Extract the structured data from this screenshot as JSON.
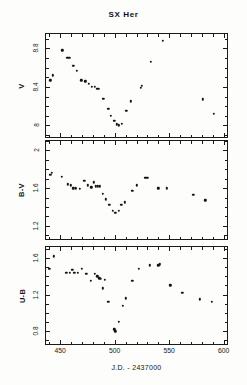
{
  "figure": {
    "title": "SX Her",
    "xlabel": "J.D.  -  2437000",
    "background": "#fdfdfc",
    "marker_color": "#141414",
    "axis_color": "#1a1a1a"
  },
  "panels": [
    {
      "id": "panel-v",
      "ylabel": "V",
      "yticks": [
        "8",
        "8.4",
        "8.8"
      ],
      "ylim_top": 7.88,
      "ylim_bottom": 8.95
    },
    {
      "id": "panel-bv",
      "ylabel": "B-V",
      "yticks": [
        "1.2",
        "1.6",
        "2"
      ],
      "ylim_top": 1.06,
      "ylim_bottom": 2.1
    },
    {
      "id": "panel-ub",
      "ylabel": "U-B",
      "yticks": [
        "0.8",
        "1.2",
        "1.6"
      ],
      "ylim_top": 0.66,
      "ylim_bottom": 1.72
    }
  ],
  "xaxis": {
    "ticks": [
      "450",
      "500",
      "550",
      "600"
    ],
    "tick_values": [
      450,
      500,
      550,
      600
    ],
    "xlim": [
      437,
      603
    ]
  },
  "chart_data": {
    "type": "scatter",
    "title": "SX Her",
    "xlabel": "J.D.  -  2437000",
    "ylabel": "",
    "xlim": [
      437,
      603
    ],
    "grid": false,
    "legend": "none",
    "panels": [
      {
        "name": "V",
        "ylabel": "V",
        "ylim": [
          8.95,
          7.88
        ],
        "y_inverted": true,
        "yticks": [
          8,
          8.4,
          8.8
        ],
        "xticks": [
          450,
          500,
          550,
          600
        ],
        "points": [
          {
            "x": 441.0,
            "y": 8.47
          },
          {
            "x": 443.5,
            "y": 8.52
          },
          {
            "x": 452.0,
            "y": 8.78
          },
          {
            "x": 456.5,
            "y": 8.7
          },
          {
            "x": 458.5,
            "y": 8.7
          },
          {
            "x": 462.0,
            "y": 8.62
          },
          {
            "x": 465.0,
            "y": 8.57
          },
          {
            "x": 469.5,
            "y": 8.47
          },
          {
            "x": 473.0,
            "y": 8.46
          },
          {
            "x": 476.0,
            "y": 8.43
          },
          {
            "x": 479.0,
            "y": 8.4
          },
          {
            "x": 482.0,
            "y": 8.4
          },
          {
            "x": 484.0,
            "y": 8.38
          },
          {
            "x": 485.5,
            "y": 8.38
          },
          {
            "x": 489.5,
            "y": 8.28
          },
          {
            "x": 494.0,
            "y": 8.17
          },
          {
            "x": 496.5,
            "y": 8.1
          },
          {
            "x": 499.5,
            "y": 8.05
          },
          {
            "x": 502.0,
            "y": 8.01
          },
          {
            "x": 504.0,
            "y": 8.0
          },
          {
            "x": 506.5,
            "y": 8.02
          },
          {
            "x": 510.5,
            "y": 8.15
          },
          {
            "x": 515.0,
            "y": 8.25
          },
          {
            "x": 524.0,
            "y": 8.39
          },
          {
            "x": 524.8,
            "y": 8.41
          },
          {
            "x": 533.0,
            "y": 8.66
          },
          {
            "x": 544.0,
            "y": 8.88
          },
          {
            "x": 581.0,
            "y": 8.27
          },
          {
            "x": 591.0,
            "y": 8.12
          }
        ]
      },
      {
        "name": "B-V",
        "ylabel": "B-V",
        "ylim": [
          2.1,
          1.06
        ],
        "y_inverted": true,
        "yticks": [
          1.2,
          1.6,
          2.0
        ],
        "xticks": [
          450,
          500,
          550,
          600
        ],
        "points": [
          {
            "x": 441.0,
            "y": 1.74
          },
          {
            "x": 442.5,
            "y": 1.76
          },
          {
            "x": 451.5,
            "y": 1.72
          },
          {
            "x": 457.0,
            "y": 1.64
          },
          {
            "x": 459.5,
            "y": 1.63
          },
          {
            "x": 462.0,
            "y": 1.6
          },
          {
            "x": 464.5,
            "y": 1.6
          },
          {
            "x": 468.0,
            "y": 1.59
          },
          {
            "x": 472.0,
            "y": 1.68
          },
          {
            "x": 475.5,
            "y": 1.63
          },
          {
            "x": 478.5,
            "y": 1.61
          },
          {
            "x": 481.0,
            "y": 1.66
          },
          {
            "x": 482.5,
            "y": 1.62
          },
          {
            "x": 484.5,
            "y": 1.62
          },
          {
            "x": 486.5,
            "y": 1.62
          },
          {
            "x": 489.0,
            "y": 1.54
          },
          {
            "x": 492.0,
            "y": 1.48
          },
          {
            "x": 495.0,
            "y": 1.42
          },
          {
            "x": 498.5,
            "y": 1.36
          },
          {
            "x": 500.5,
            "y": 1.34
          },
          {
            "x": 503.5,
            "y": 1.36
          },
          {
            "x": 506.0,
            "y": 1.42
          },
          {
            "x": 509.0,
            "y": 1.45
          },
          {
            "x": 516.0,
            "y": 1.57
          },
          {
            "x": 520.0,
            "y": 1.63
          },
          {
            "x": 528.0,
            "y": 1.71
          },
          {
            "x": 530.0,
            "y": 1.71
          },
          {
            "x": 540.0,
            "y": 1.6
          },
          {
            "x": 548.0,
            "y": 1.6
          },
          {
            "x": 572.0,
            "y": 1.53
          },
          {
            "x": 583.0,
            "y": 1.47
          }
        ]
      },
      {
        "name": "U-B",
        "ylabel": "U-B",
        "ylim": [
          1.72,
          0.66
        ],
        "y_inverted": true,
        "yticks": [
          0.8,
          1.2,
          1.6
        ],
        "xticks": [
          450,
          500,
          550,
          600
        ],
        "points": [
          {
            "x": 440.0,
            "y": 1.48
          },
          {
            "x": 444.0,
            "y": 1.62
          },
          {
            "x": 455.5,
            "y": 1.44
          },
          {
            "x": 459.0,
            "y": 1.44
          },
          {
            "x": 461.0,
            "y": 1.47
          },
          {
            "x": 463.0,
            "y": 1.44
          },
          {
            "x": 466.0,
            "y": 1.44
          },
          {
            "x": 470.0,
            "y": 1.48
          },
          {
            "x": 474.0,
            "y": 1.43
          },
          {
            "x": 478.0,
            "y": 1.35
          },
          {
            "x": 482.0,
            "y": 1.43
          },
          {
            "x": 484.0,
            "y": 1.4
          },
          {
            "x": 486.0,
            "y": 1.38
          },
          {
            "x": 487.5,
            "y": 1.37
          },
          {
            "x": 489.0,
            "y": 1.27
          },
          {
            "x": 491.0,
            "y": 1.36
          },
          {
            "x": 494.0,
            "y": 1.12
          },
          {
            "x": 499.5,
            "y": 0.82
          },
          {
            "x": 500.5,
            "y": 0.8
          },
          {
            "x": 503.5,
            "y": 0.9
          },
          {
            "x": 507.5,
            "y": 1.08
          },
          {
            "x": 510.0,
            "y": 1.16
          },
          {
            "x": 516.0,
            "y": 1.35
          },
          {
            "x": 522.0,
            "y": 1.48
          },
          {
            "x": 532.0,
            "y": 1.52
          },
          {
            "x": 540.0,
            "y": 1.52
          },
          {
            "x": 541.5,
            "y": 1.53
          },
          {
            "x": 551.0,
            "y": 1.3
          },
          {
            "x": 562.0,
            "y": 1.22
          },
          {
            "x": 578.0,
            "y": 1.15
          },
          {
            "x": 589.0,
            "y": 1.12
          }
        ]
      }
    ]
  }
}
